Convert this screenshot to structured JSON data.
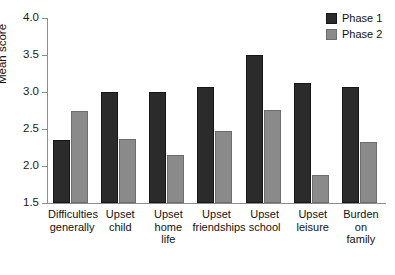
{
  "chart_data": {
    "type": "bar",
    "title": "",
    "xlabel": "",
    "ylabel": "Mean score",
    "ylim": [
      1.5,
      4.0
    ],
    "ytick_values": [
      1.5,
      2.0,
      2.5,
      3.0,
      3.5,
      4.0
    ],
    "ytick_labels": [
      "1.5",
      "2.0",
      "2.5",
      "3.0",
      "3.5",
      "4.0"
    ],
    "grid": false,
    "legend_position": "top-right",
    "categories": [
      "Difficulties generally",
      "Upset child",
      "Upset home life",
      "Upset friendships",
      "Upset school",
      "Upset leisure",
      "Burden on family"
    ],
    "category_lines": [
      [
        "Difficulties",
        "generally"
      ],
      [
        "Upset",
        "child"
      ],
      [
        "Upset",
        "home",
        "life"
      ],
      [
        "Upset",
        "friendships"
      ],
      [
        "Upset",
        "school"
      ],
      [
        "Upset",
        "leisure"
      ],
      [
        "Burden",
        "on",
        "family"
      ]
    ],
    "series": [
      {
        "name": "Phase 1",
        "color": "#2b2b2b",
        "values": [
          2.35,
          3.0,
          3.0,
          3.07,
          3.5,
          3.12,
          3.07
        ]
      },
      {
        "name": "Phase 2",
        "color": "#8a8a8a",
        "values": [
          2.75,
          2.37,
          2.15,
          2.47,
          2.76,
          1.88,
          2.32
        ]
      }
    ]
  },
  "legend": {
    "items": [
      {
        "label": "Phase 1",
        "swatch": "phase-1-swatch"
      },
      {
        "label": "Phase 2",
        "swatch": "phase-2-swatch"
      }
    ]
  },
  "axes": {
    "y_title": "Mean score"
  }
}
